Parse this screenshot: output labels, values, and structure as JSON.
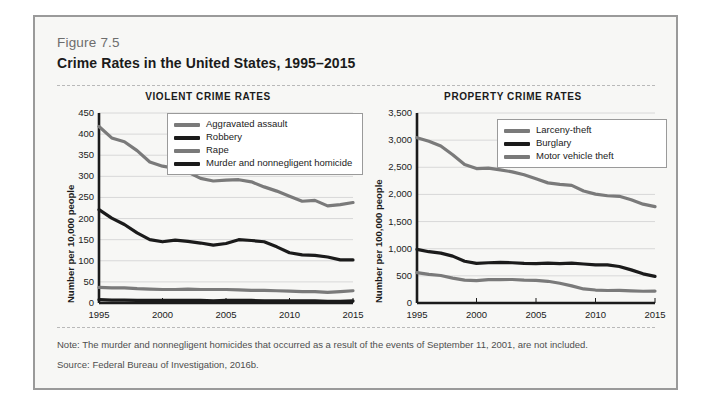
{
  "figure": {
    "number": "Figure 7.5",
    "title": "Crime Rates in the United States, 1995–2015",
    "note": "Note: The murder and nonnegligent homicides that occurred as a result of the events of September 11, 2001, are not included.",
    "source": "Source: Federal Bureau of Investigation, 2016b."
  },
  "colors": {
    "frame_border": "#9a9a9a",
    "panel_background": "#f7f7f5",
    "gray_series": "#7a7a7a",
    "black_series": "#1b1b1b",
    "gridline": "#d8d8d8",
    "axis": "#1b1b1b"
  },
  "chart_data": [
    {
      "type": "line",
      "title": "VIOLENT CRIME RATES",
      "xlabel": "",
      "ylabel": "Number per 10,000 people",
      "xlim": [
        1995,
        2015
      ],
      "ylim": [
        0,
        450
      ],
      "yticks": [
        0,
        50,
        100,
        150,
        200,
        250,
        300,
        350,
        400,
        450
      ],
      "ytick_labels": [
        "0",
        "50",
        "100",
        "150",
        "200",
        "250",
        "300",
        "350",
        "400",
        "450"
      ],
      "xticks": [
        1995,
        2000,
        2005,
        2010,
        2015
      ],
      "xtick_labels": [
        "1995",
        "2000",
        "2005",
        "2010",
        "2015"
      ],
      "grid": true,
      "legend_position": "upper right",
      "x": [
        1995,
        1996,
        1997,
        1998,
        1999,
        2000,
        2001,
        2002,
        2003,
        2004,
        2005,
        2006,
        2007,
        2008,
        2009,
        2010,
        2011,
        2012,
        2013,
        2014,
        2015
      ],
      "series": [
        {
          "name": "Aggravated assault",
          "color": "#7a7a7a",
          "values": [
            418,
            391,
            382,
            361,
            334,
            324,
            319,
            310,
            295,
            289,
            291,
            292,
            287,
            275,
            265,
            253,
            241,
            243,
            230,
            233,
            238
          ]
        },
        {
          "name": "Robbery",
          "color": "#1b1b1b",
          "values": [
            221,
            201,
            186,
            166,
            150,
            145,
            149,
            146,
            142,
            137,
            141,
            150,
            148,
            145,
            133,
            119,
            114,
            113,
            109,
            102,
            102
          ]
        },
        {
          "name": "Rape",
          "color": "#7a7a7a",
          "values": [
            37,
            36,
            36,
            34,
            33,
            32,
            32,
            33,
            32,
            32,
            32,
            31,
            30,
            30,
            29,
            28,
            27,
            27,
            25,
            27,
            29
          ]
        },
        {
          "name": "Murder and nonnegligent homicide",
          "color": "#1b1b1b",
          "values": [
            8,
            7,
            7,
            6,
            6,
            6,
            6,
            6,
            6,
            5,
            6,
            6,
            6,
            5,
            5,
            5,
            5,
            5,
            4,
            4,
            5
          ]
        }
      ]
    },
    {
      "type": "line",
      "title": "PROPERTY CRIME RATES",
      "xlabel": "",
      "ylabel": "Number per 100,000 people",
      "xlim": [
        1995,
        2015
      ],
      "ylim": [
        0,
        3500
      ],
      "yticks": [
        0,
        500,
        1000,
        1500,
        2000,
        2500,
        3000,
        3500
      ],
      "ytick_labels": [
        "0",
        "500",
        "1,000",
        "1,500",
        "2,000",
        "2,500",
        "3,000",
        "3,500"
      ],
      "xticks": [
        1995,
        2000,
        2005,
        2010,
        2015
      ],
      "xtick_labels": [
        "1995",
        "2000",
        "2005",
        "2010",
        "2015"
      ],
      "grid": true,
      "legend_position": "upper right",
      "x": [
        1995,
        1996,
        1997,
        1998,
        1999,
        2000,
        2001,
        2002,
        2003,
        2004,
        2005,
        2006,
        2007,
        2008,
        2009,
        2010,
        2011,
        2012,
        2013,
        2014,
        2015
      ],
      "series": [
        {
          "name": "Larceny-theft",
          "color": "#7a7a7a",
          "values": [
            3045,
            2980,
            2892,
            2730,
            2551,
            2477,
            2486,
            2451,
            2416,
            2362,
            2288,
            2213,
            2185,
            2167,
            2064,
            2005,
            1976,
            1965,
            1901,
            1821,
            1775
          ]
        },
        {
          "name": "Burglary",
          "color": "#1b1b1b",
          "values": [
            987,
            945,
            919,
            863,
            770,
            729,
            741,
            747,
            741,
            730,
            727,
            733,
            726,
            733,
            718,
            701,
            702,
            672,
            610,
            537,
            491
          ]
        },
        {
          "name": "Motor vehicle theft",
          "color": "#7a7a7a",
          "values": [
            560,
            526,
            506,
            459,
            422,
            412,
            431,
            432,
            433,
            422,
            417,
            400,
            364,
            315,
            259,
            239,
            230,
            231,
            222,
            216,
            220
          ]
        }
      ]
    }
  ]
}
